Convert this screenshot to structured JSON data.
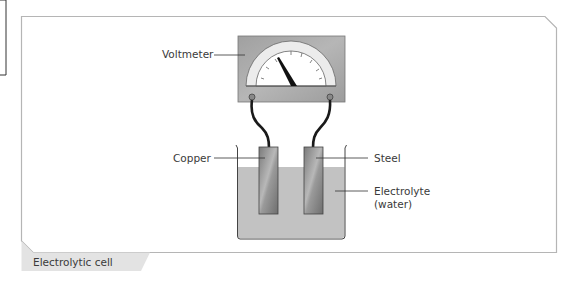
{
  "figure": {
    "caption": "Electrolytic cell",
    "labels": {
      "voltmeter": "Voltmeter",
      "copper": "Copper",
      "steel": "Steel",
      "electrolyte_line1": "Electrolyte",
      "electrolyte_line2": "(water)"
    },
    "colors": {
      "frame": "#b5b5b5",
      "caption_tab": "#e3e3e3",
      "meter_body": "#a9a9a9",
      "dial_arc": "#ececec",
      "electrode": "#8c8c8c",
      "electrolyte": "#c2c2c2",
      "wire": "#1a1a1a"
    }
  }
}
